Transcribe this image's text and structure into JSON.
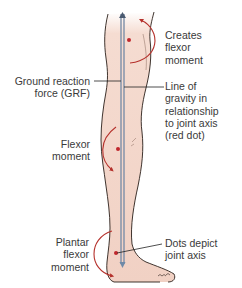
{
  "figure": {
    "colors": {
      "skin": "#f2d3c6",
      "skin_light": "#f8e6de",
      "outline": "#2a1f1a",
      "grf_line": "#7c8fa8",
      "moment_arrow": "#b5312c",
      "joint_dot": "#c0272d",
      "leader": "#222222",
      "text": "#3a3a3a"
    }
  },
  "labels": {
    "hip": "Creates\nflexor\nmoment",
    "grf": "Ground reaction\nforce (GRF)",
    "gravity": "Line of\ngravity in\nrelationship\nto joint axis\n(red dot)",
    "knee": "Flexor\nmoment",
    "ankle": "Plantar\nflexor\nmoment",
    "dots": "Dots depict\njoint axis"
  }
}
